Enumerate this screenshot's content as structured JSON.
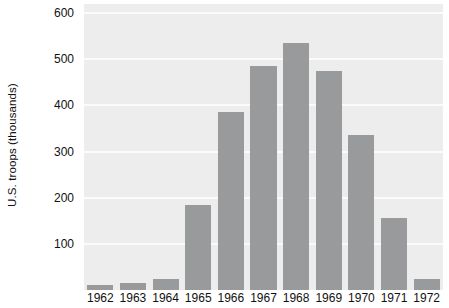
{
  "chart_data": {
    "type": "bar",
    "title": "",
    "xlabel": "",
    "ylabel": "U.S. troops (thousands)",
    "categories": [
      "1962",
      "1963",
      "1964",
      "1965",
      "1966",
      "1967",
      "1968",
      "1969",
      "1970",
      "1971",
      "1972"
    ],
    "values": [
      11,
      16,
      23,
      184,
      385,
      485,
      536,
      475,
      335,
      156,
      24
    ],
    "ylim": [
      0,
      620
    ],
    "yticks": [
      100,
      200,
      300,
      400,
      500,
      600
    ],
    "ytick_labels": [
      "100",
      "200",
      "300",
      "400",
      "500",
      "600"
    ],
    "grid": true,
    "grid_axis": "y",
    "legend": "none",
    "colors": {
      "bar": "#999a9b",
      "plot_background": "#ededee",
      "gridline": "#fbfbfb",
      "figure_background": "#ffffff",
      "text": "#111111"
    }
  }
}
